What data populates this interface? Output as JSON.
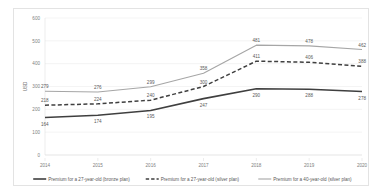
{
  "chart_data": {
    "type": "line",
    "title": "",
    "xlabel": "",
    "ylabel": "USD",
    "categories": [
      "2014",
      "2015",
      "2016",
      "2017",
      "2018",
      "2019",
      "2020"
    ],
    "ylim": [
      0,
      600
    ],
    "yticks": [
      "0",
      "100",
      "200",
      "300",
      "400",
      "500",
      "600"
    ],
    "grid": true,
    "legend_position": "bottom",
    "series": [
      {
        "name": "Premium for a 27-year-old (bronze plan)",
        "values": [
          164,
          174,
          195,
          247,
          290,
          288,
          278
        ],
        "color": "#3f3f3f",
        "style": "solid",
        "width": 1.6
      },
      {
        "name": "Premium for a 27-year-old (silver plan)",
        "values": [
          218,
          224,
          240,
          300,
          411,
          406,
          388
        ],
        "color": "#3f3f3f",
        "style": "dashed",
        "width": 1.5
      },
      {
        "name": "Premium for a 40-year-old (silver plan)",
        "values": [
          279,
          276,
          299,
          358,
          481,
          478,
          462
        ],
        "color": "#a6a6a6",
        "style": "solid",
        "width": 1.1
      }
    ]
  },
  "colors": {
    "card_border": "#e3e3e3",
    "gridline": "#e8e8e8",
    "axis": "#d9d9d9",
    "tick_label": "#808080",
    "data_label": "#595959",
    "background": "#ffffff"
  }
}
